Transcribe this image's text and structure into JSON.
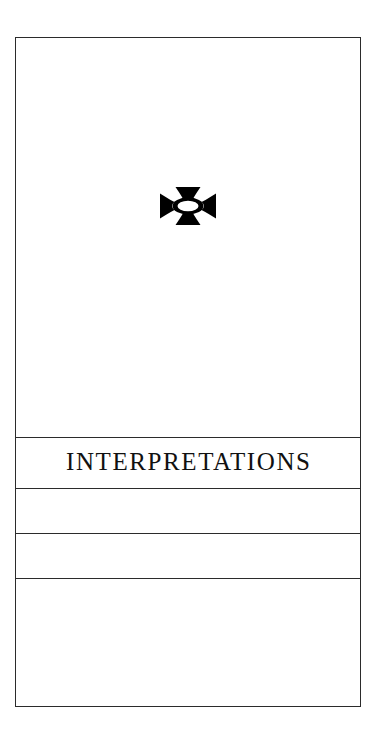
{
  "page": {
    "background_color": "#ffffff",
    "ink_color": "#2b2b2b",
    "text_color": "#111111",
    "width": 381,
    "height": 752
  },
  "frame": {
    "name": "bordered-table-frame",
    "border_color": "#2b2b2b"
  },
  "ornament": {
    "icon_name": "maltese-cross-ornament",
    "description": "Printer's ornament: solid black cross patty with white elliptical center",
    "fill_color": "#000000",
    "center_fill_color": "#ffffff"
  },
  "heading": {
    "label": "INTERPRETATIONS"
  },
  "rows": [
    {
      "name": "blank-row-1",
      "label": ""
    },
    {
      "name": "blank-row-2",
      "label": ""
    },
    {
      "name": "blank-row-3",
      "label": ""
    }
  ]
}
